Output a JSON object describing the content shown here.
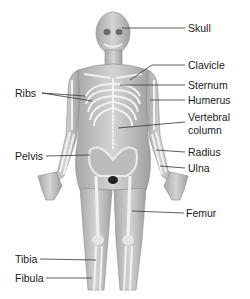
{
  "diagram": {
    "type": "anatomical-skeleton-labeled",
    "labels_right": [
      {
        "id": "skull",
        "text": "Skull",
        "x": 188,
        "y": 22
      },
      {
        "id": "clavicle",
        "text": "Clavicle",
        "x": 188,
        "y": 59
      },
      {
        "id": "sternum",
        "text": "Sternum",
        "x": 188,
        "y": 79
      },
      {
        "id": "humerus",
        "text": "Humerus",
        "x": 188,
        "y": 94
      },
      {
        "id": "vertebral",
        "text": "Vertebral",
        "x": 188,
        "y": 111
      },
      {
        "id": "column",
        "text": "column",
        "x": 188,
        "y": 124
      },
      {
        "id": "radius",
        "text": "Radius",
        "x": 188,
        "y": 146
      },
      {
        "id": "ulna",
        "text": "Ulna",
        "x": 188,
        "y": 162
      },
      {
        "id": "femur",
        "text": "Femur",
        "x": 186,
        "y": 207
      }
    ],
    "labels_left": [
      {
        "id": "ribs",
        "text": "Ribs",
        "x": 15,
        "y": 87
      },
      {
        "id": "pelvis",
        "text": "Pelvis",
        "x": 15,
        "y": 150
      },
      {
        "id": "tibia",
        "text": "Tibia",
        "x": 15,
        "y": 253
      },
      {
        "id": "fibula",
        "text": "Fibula",
        "x": 15,
        "y": 272
      }
    ],
    "line_color": "#333333",
    "body_color": "#c8c8c8",
    "bone_color": "#efefef"
  }
}
